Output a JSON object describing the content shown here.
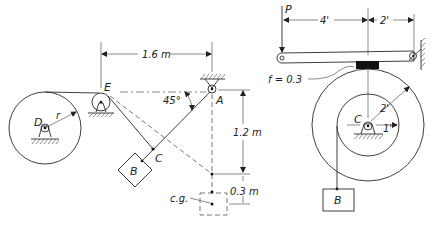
{
  "figure_left": {
    "labels": {
      "D": "D",
      "r": "r",
      "E": "E",
      "A": "A",
      "C": "C",
      "B": "B",
      "cg": "c.g.",
      "angle": "45°"
    },
    "dimensions": {
      "horizontal_EA": "1.6 m",
      "vertical_A_to_cable": "1.2 m",
      "vertical_offset_cg": "0.3 m"
    }
  },
  "figure_right": {
    "labels": {
      "P": "P",
      "C": "C",
      "B": "B",
      "friction": "f = 0.3"
    },
    "dimensions": {
      "lever_left": "4'",
      "lever_right": "2'",
      "outer_radius": "2'",
      "inner_radius": "1'"
    }
  },
  "colors": {
    "ink": "#2a2a2a",
    "background": "#ffffff",
    "brake_pad": "#111111"
  }
}
